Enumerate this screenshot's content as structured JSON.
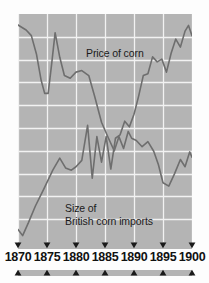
{
  "chart_data": {
    "type": "line",
    "title": "",
    "subtitle": "",
    "xlabel": "",
    "ylabel": "",
    "xlim": [
      1870,
      1900
    ],
    "ylim": [
      0,
      10
    ],
    "grid": true,
    "grid_x_at": [
      1870,
      1875,
      1880,
      1885,
      1890,
      1895,
      1900
    ],
    "grid_y_count": 10,
    "legend_position": "inline-annotation",
    "plot_background": "#b4b4b4",
    "grid_color": "#f2f2f2",
    "line_color": "#6e6e6e",
    "axis_tick_years": [
      1870,
      1875,
      1880,
      1885,
      1890,
      1895,
      1900
    ],
    "annotations": [
      {
        "name": "price-label",
        "text": "Price of corn",
        "x": 1882,
        "y": 8.5
      },
      {
        "name": "imports-label",
        "text": "Size of\nBritish corn imports",
        "x": 1875,
        "y": 1.9
      }
    ],
    "series": [
      {
        "name": "Price of corn",
        "label": "Price of corn",
        "color": "#6e6e6e",
        "x": [
          1870.0,
          1871.4,
          1872.3,
          1873.2,
          1874.0,
          1874.6,
          1875.2,
          1875.8,
          1876.4,
          1877.2,
          1878.0,
          1879.0,
          1880.0,
          1881.0,
          1882.2,
          1883.2,
          1884.4,
          1885.6,
          1886.6,
          1887.4,
          1888.2,
          1889.0,
          1889.6,
          1890.4,
          1891.4,
          1892.4,
          1893.4,
          1894.2,
          1895.0,
          1896.0,
          1897.0,
          1898.0,
          1898.8,
          1899.6,
          1900.0
        ],
        "y": [
          9.52,
          9.3,
          9.05,
          8.22,
          7.08,
          6.52,
          6.52,
          7.8,
          9.18,
          8.1,
          7.3,
          7.18,
          7.45,
          7.52,
          7.3,
          6.4,
          5.25,
          4.55,
          4.0,
          4.62,
          4.1,
          4.85,
          4.55,
          4.45,
          4.18,
          4.4,
          3.98,
          3.4,
          2.6,
          2.45,
          3.0,
          3.62,
          3.3,
          3.95,
          3.72
        ]
      },
      {
        "name": "Size of British corn imports",
        "label": "Size of British corn imports",
        "color": "#6e6e6e",
        "x": [
          1870.0,
          1870.8,
          1871.8,
          1873.0,
          1874.4,
          1876.0,
          1877.2,
          1878.2,
          1879.2,
          1880.0,
          1881.0,
          1882.0,
          1882.8,
          1883.6,
          1884.4,
          1885.2,
          1886.0,
          1886.8,
          1887.6,
          1888.4,
          1889.2,
          1890.0,
          1890.8,
          1891.6,
          1892.4,
          1893.2,
          1894.0,
          1894.8,
          1895.6,
          1896.4,
          1897.2,
          1898.0,
          1898.8,
          1899.4,
          1900.0
        ],
        "y": [
          0.55,
          0.28,
          0.85,
          1.58,
          2.3,
          3.15,
          3.68,
          3.25,
          3.15,
          3.3,
          3.58,
          5.12,
          2.8,
          4.62,
          3.5,
          4.62,
          3.2,
          4.55,
          4.7,
          5.3,
          5.05,
          5.6,
          6.4,
          7.3,
          7.38,
          8.12,
          7.9,
          8.02,
          7.45,
          8.28,
          8.9,
          8.55,
          9.25,
          9.5,
          9.05
        ]
      }
    ]
  },
  "axis": {
    "tick_labels": [
      "1870",
      "1875",
      "1880",
      "1885",
      "1890",
      "1895",
      "1900"
    ],
    "tick_marker_down": "▼",
    "tick_marker_up": "▲"
  },
  "colors": {
    "plot_background": "#b4b4b4",
    "gridline": "#f2f2f2",
    "line": "#6e6e6e",
    "axis_bar": "#b4b4b4",
    "text": "#111111",
    "page_background": "#fdfdfd"
  }
}
